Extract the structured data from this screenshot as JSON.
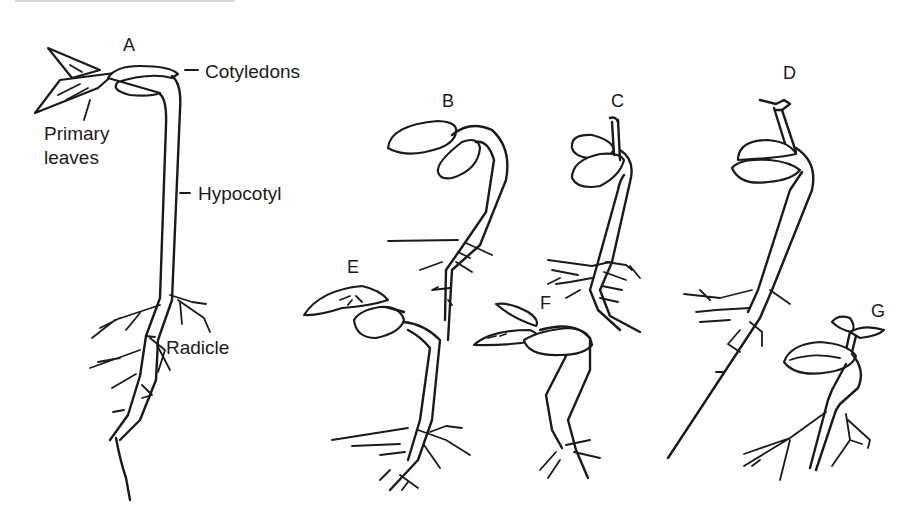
{
  "figure": {
    "type": "botanical line drawing",
    "seedlings": [
      {
        "id": "A",
        "label": "A"
      },
      {
        "id": "B",
        "label": "B"
      },
      {
        "id": "C",
        "label": "C"
      },
      {
        "id": "D",
        "label": "D"
      },
      {
        "id": "E",
        "label": "E"
      },
      {
        "id": "F",
        "label": "F"
      },
      {
        "id": "G",
        "label": "G"
      }
    ],
    "annotations": {
      "cotyledons": "Cotyledons",
      "primary_leaves_line1": "Primary",
      "primary_leaves_line2": "leaves",
      "hypocotyl": "Hypocotyl",
      "radicle": "Radicle"
    },
    "colors": {
      "ink": "#1a1a1a",
      "background": "#ffffff"
    }
  }
}
